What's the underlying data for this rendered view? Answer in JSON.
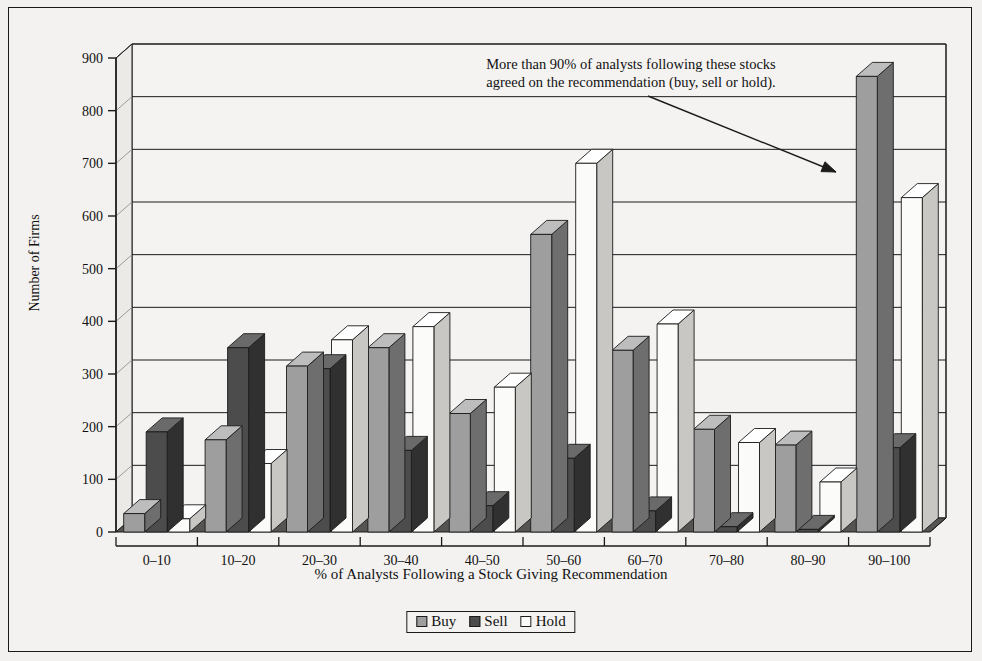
{
  "figure": {
    "annotation": "More than 90% of analysts following these stocks agreed on the recommendation (buy, sell or hold).",
    "annotation_line1": "More than 90% of analysts following these stocks",
    "annotation_line2": "agreed on the recommendation (buy, sell or hold)."
  },
  "legend": {
    "items": [
      {
        "label": "Buy",
        "color": "#9e9e9e"
      },
      {
        "label": "Sell",
        "color": "#4c4c4c"
      },
      {
        "label": "Hold",
        "color": "#fbfbf9"
      }
    ]
  },
  "chart_data": {
    "type": "bar",
    "title": "",
    "xlabel": "% of Analysts Following a Stock Giving Recommendation",
    "ylabel": "Number of Firms",
    "ylim": [
      0,
      900
    ],
    "ytick_step": 100,
    "yticks": [
      "0",
      "100",
      "200",
      "300",
      "400",
      "500",
      "600",
      "700",
      "800",
      "900"
    ],
    "grid": true,
    "legend_position": "bottom",
    "style": "3d-grouped-column",
    "categories": [
      "0–10",
      "10–20",
      "20–30",
      "30–40",
      "40–50",
      "50–60",
      "60–70",
      "70–80",
      "80–90",
      "90–100"
    ],
    "series": [
      {
        "name": "Buy",
        "color": "#9e9e9e",
        "values": [
          35,
          175,
          315,
          350,
          225,
          565,
          345,
          195,
          165,
          865
        ]
      },
      {
        "name": "Sell",
        "color": "#4c4c4c",
        "values": [
          190,
          350,
          310,
          155,
          50,
          140,
          40,
          10,
          5,
          160
        ]
      },
      {
        "name": "Hold",
        "color": "#fbfbf9",
        "values": [
          25,
          130,
          365,
          390,
          275,
          700,
          395,
          170,
          95,
          635
        ]
      }
    ],
    "annotations": [
      {
        "text": "More than 90% of analysts following these stocks agreed on the recommendation (buy, sell or hold).",
        "points_to_category": "90–100"
      }
    ]
  }
}
